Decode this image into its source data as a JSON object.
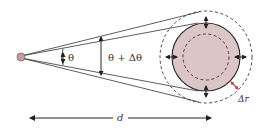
{
  "diagram": {
    "labels": {
      "theta": "θ",
      "theta_plus_delta": "θ + Δθ",
      "distance": "d",
      "delta_r": "Δr"
    },
    "colors": {
      "fill": "#dcc5c7",
      "source_fill": "#c99a9e",
      "stroke": "#222222",
      "delta_r_arrow": "#b0505a",
      "text": "#333333"
    },
    "elements": [
      "point-source",
      "tangent-lines-inner",
      "tangent-lines-outer",
      "angle-theta-arrow",
      "angle-theta-plus-delta-arrow",
      "object-circle",
      "inner-dashed-circle",
      "outer-dashed-circle",
      "expansion-arrows",
      "delta-r-arrow",
      "distance-arrow"
    ]
  }
}
